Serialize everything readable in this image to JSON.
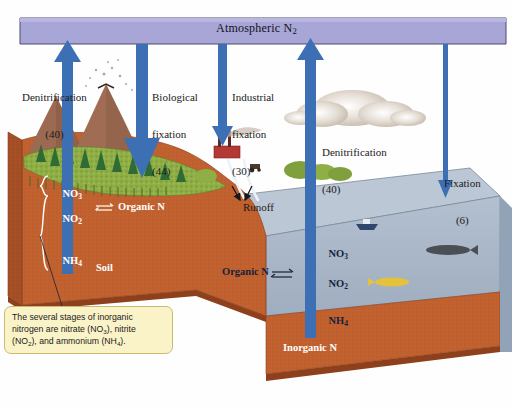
{
  "figure": {
    "banner_label": "Atmospheric N",
    "banner_sub": "2"
  },
  "colors": {
    "banner_fill": "#a8a6d6",
    "banner_stroke": "#4a4a6e",
    "arrow_blue": "#3d6fb5",
    "arrow_blue_dark": "#2f5e9e",
    "soil": "#c1612f",
    "soil_shadow": "#a44f25",
    "soil_side": "#b0572a",
    "water": "#a8b6c8",
    "water_side": "#93a3b7",
    "water_top": "#bcc7d6",
    "vegetation": "#86a83e",
    "mountain": "#9c6a52",
    "cloud": "#cdc2b6",
    "callout_fill": "#fbf3c8",
    "callout_stroke": "#c9ba72",
    "factory_red": "#b33a33"
  },
  "flux_labels": [
    {
      "id": "denitrification-land",
      "line1": "Denitrification",
      "line2": "(40)",
      "value": 40,
      "direction": "up",
      "x": 22,
      "y": 66
    },
    {
      "id": "biological-fixation",
      "line1": "Biological",
      "line2": "fixation",
      "line3": "(44)",
      "value": 44,
      "direction": "down",
      "x": 152,
      "y": 66
    },
    {
      "id": "industrial-fixation",
      "line1": "Industrial",
      "line2": "fixation",
      "line3": "(30)",
      "value": 30,
      "direction": "down",
      "x": 232,
      "y": 66
    },
    {
      "id": "denitrification-ocean",
      "line1": "Denitrification",
      "line2": "(40)",
      "value": 40,
      "direction": "up",
      "x": 322,
      "y": 121
    },
    {
      "id": "fixation-ocean",
      "line1": "Fixation",
      "line2": "(6)",
      "value": 6,
      "direction": "down",
      "x": 444,
      "y": 152
    }
  ],
  "soil_compartment": {
    "name_label": "Soil",
    "species": [
      {
        "id": "soil-no3",
        "text": "NO",
        "sub": "3"
      },
      {
        "id": "soil-no2",
        "text": "NO",
        "sub": "2"
      },
      {
        "id": "soil-nh4",
        "text": "NH",
        "sub": "4"
      }
    ],
    "organic_label": "Organic N",
    "equilibrium_glyph": "⇌"
  },
  "water_compartment": {
    "species": [
      {
        "id": "water-no3",
        "text": "NO",
        "sub": "3"
      },
      {
        "id": "water-no2",
        "text": "NO",
        "sub": "2"
      },
      {
        "id": "water-nh4",
        "text": "NH",
        "sub": "4"
      }
    ],
    "organic_label": "Organic N",
    "equilibrium_glyph": "⇌"
  },
  "sediment": {
    "label": "Inorganic N"
  },
  "runoff": {
    "label": "Runoff"
  },
  "callout": {
    "line1": "The several stages of inorganic",
    "line2_a": "nitrogen are nitrate (NO",
    "line2_sub": "3",
    "line2_b": "), nitrite",
    "line3_a": "(NO",
    "line3_sub": "2",
    "line3_b": "), and ammonium (NH",
    "line3_sub2": "4",
    "line3_c": ")."
  },
  "scene_objects": [
    {
      "name": "volcano",
      "count": 1
    },
    {
      "name": "mountain",
      "count": 2
    },
    {
      "name": "conifer-tree",
      "count": 14
    },
    {
      "name": "cloud",
      "count": 1
    },
    {
      "name": "factory",
      "count": 1
    },
    {
      "name": "tractor",
      "count": 1
    },
    {
      "name": "boat",
      "count": 1
    },
    {
      "name": "fish",
      "count": 2
    },
    {
      "name": "river-channel",
      "count": 2
    }
  ]
}
